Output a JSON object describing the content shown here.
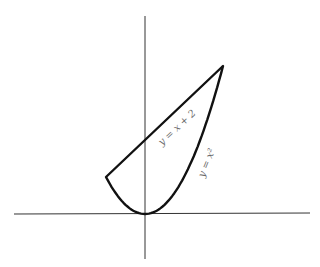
{
  "figure": {
    "title": "",
    "axes": {
      "x_axis": {
        "from": -3.4,
        "to": 4.3
      },
      "y_axis": {
        "from": -1.2,
        "to": 5.4
      },
      "origin_px": [
        145,
        214
      ],
      "ticks": false
    },
    "curves": [
      {
        "name": "line",
        "label": "y = x + 2",
        "equation": "y = x + 2",
        "x_range": [
          -1,
          2
        ]
      },
      {
        "name": "parabola",
        "label": "y = x²",
        "equation": "y = x^2",
        "x_range": [
          -1,
          2
        ]
      }
    ],
    "intersections": [
      {
        "x": -1,
        "y": 1
      },
      {
        "x": 2,
        "y": 4
      }
    ],
    "region": "bounded region between y = x + 2 and y = x²"
  },
  "colors": {
    "curve": "#111111",
    "axis": "#333333",
    "label": "#6a6a6a"
  }
}
